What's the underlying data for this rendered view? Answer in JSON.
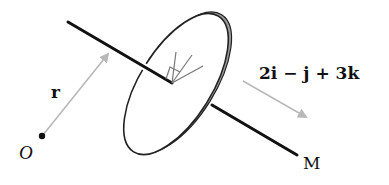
{
  "diagram": {
    "labels": {
      "origin": "O",
      "position_vector": "r",
      "direction_vector": "2i − j + 3k",
      "line_end": "M"
    },
    "colors": {
      "line": "#111111",
      "arrow": "#b8b8b8",
      "disk_rim": "#8a8a8a",
      "disk_face": "#ffffff"
    }
  }
}
